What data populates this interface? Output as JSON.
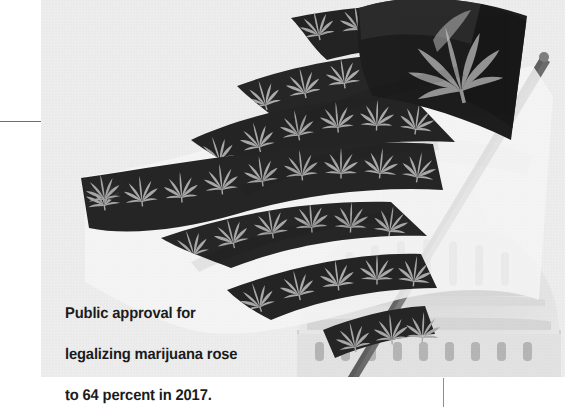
{
  "page": {
    "kind": "magazine-photo-with-caption",
    "background_color": "#ffffff"
  },
  "photo": {
    "name": "marijuana-leaf-american-flag-over-us-capitol",
    "description": "Black and white photograph of an American flag whose stars are replaced by a large cannabis leaf and whose dark stripes are patterned with repeating cannabis leaves, waving on a diagonal flagpole in front of the dome of the United States Capitol.",
    "treatment": "black-and-white",
    "paper_tint": "#ededed",
    "ink_dark": "#1d1d1d",
    "ink_mid": "#9a9a9a",
    "dome_tint": "#d8d8d8",
    "pole_color": "#7b7b7b",
    "subjects": [
      "american-flag",
      "cannabis-leaf-canton",
      "cannabis-leaf-stripes",
      "flagpole",
      "us-capitol-dome"
    ],
    "stripe_count": 7,
    "leaf_motif_count": 44
  },
  "caption": {
    "line1": "Public approval for",
    "line2": "legalizing marijuana rose",
    "line3": "to 64 percent in 2017.",
    "full_text": "Public approval for legalizing marijuana rose to 64 percent in 2017.",
    "percent_value": 64,
    "year": 2017,
    "color": "#1b1b1b"
  },
  "rules": {
    "horizontal_left": {
      "name": "left-margin-rule",
      "color": "#6e6e6e"
    },
    "vertical_bottom": {
      "name": "bottom-right-rule",
      "color": "#8d8d8d"
    }
  }
}
